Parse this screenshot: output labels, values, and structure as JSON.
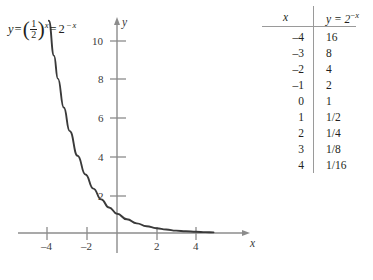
{
  "figure": {
    "equation_label": {
      "lhs": "y",
      "equals": "=",
      "base_numerator": "1",
      "base_denominator": "2",
      "exponent": "x",
      "equals2": "=",
      "rhs_base": "2",
      "rhs_exponent_sign": "−",
      "rhs_exponent": "x"
    },
    "axes": {
      "x_axis_name": "x",
      "y_axis_name": "y",
      "x_ticks": [
        {
          "value": -4,
          "label": "–4"
        },
        {
          "value": -2,
          "label": "–2"
        },
        {
          "value": 2,
          "label": "2"
        },
        {
          "value": 4,
          "label": "4"
        }
      ],
      "y_ticks": [
        {
          "value": 2,
          "label": "2"
        },
        {
          "value": 4,
          "label": "4"
        },
        {
          "value": 6,
          "label": "6"
        },
        {
          "value": 8,
          "label": "8"
        },
        {
          "value": 10,
          "label": "10"
        }
      ],
      "x_range": [
        -5.2,
        6.6
      ],
      "y_range": [
        -0.9,
        11.3
      ],
      "axis_color": "#8c8c8c",
      "curve_color": "#3a3a3a"
    }
  },
  "chart_data": {
    "type": "line",
    "title": "",
    "xlabel": "x",
    "ylabel": "y",
    "xlim": [
      -5.2,
      6.6
    ],
    "ylim": [
      -0.9,
      11.3
    ],
    "grid": false,
    "legend": null,
    "annotations": [
      "y = (1/2)^x = 2^-x"
    ],
    "function": "y = 2^(-x)",
    "series": [
      {
        "name": "y = 2^-x",
        "x": [
          -3.46,
          -3.2,
          -3.0,
          -2.7,
          -2.4,
          -2.0,
          -1.6,
          -1.2,
          -0.8,
          -0.4,
          0.0,
          0.5,
          1.0,
          1.5,
          2.0,
          2.5,
          3.0,
          3.5,
          4.0,
          4.5,
          4.9
        ],
        "values": [
          11.0,
          9.19,
          8.0,
          6.5,
          5.28,
          4.0,
          3.03,
          2.3,
          1.74,
          1.32,
          1.0,
          0.71,
          0.5,
          0.35,
          0.25,
          0.18,
          0.125,
          0.088,
          0.0625,
          0.044,
          0.033
        ]
      }
    ]
  },
  "table": {
    "headers": {
      "x": "x",
      "y_base": "y = 2",
      "y_exponent_sign": "−",
      "y_exponent": "x"
    },
    "rows": [
      {
        "x": "–4",
        "y": "16"
      },
      {
        "x": "–3",
        "y": "8"
      },
      {
        "x": "–2",
        "y": "4"
      },
      {
        "x": "–1",
        "y": "2"
      },
      {
        "x": "0",
        "y": "1"
      },
      {
        "x": "1",
        "y": "1/2"
      },
      {
        "x": "2",
        "y": "1/4"
      },
      {
        "x": "3",
        "y": "1/8"
      },
      {
        "x": "4",
        "y": "1/16"
      }
    ]
  }
}
